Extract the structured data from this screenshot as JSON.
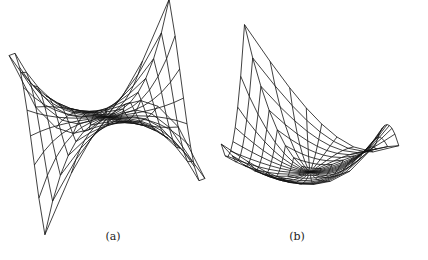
{
  "figure": {
    "panels": [
      {
        "id": "a",
        "label": "(a)"
      },
      {
        "id": "b",
        "label": "(b)"
      }
    ]
  },
  "chart_data": [
    {
      "type": "surface-wireframe",
      "title": "(a)",
      "mesh": {
        "rings": 8,
        "spokes": 32,
        "domain": "square [-1,1]x[-1,1], polar-style mesh"
      },
      "surface": "monkey-saddle-like, z = r^3 cos(3θ+φ)",
      "projection": {
        "cx": 107,
        "cy": 117,
        "A": 82,
        "B": 22,
        "H": 48,
        "psi": -0.22,
        "phi": 1.9
      },
      "stroke": "#111111",
      "grid": false,
      "axes": false
    },
    {
      "type": "surface-wireframe",
      "title": "(b)",
      "mesh": {
        "rings": 8,
        "spokes": 32,
        "domain": "square [-1,1]x[-1,1], polar-style mesh"
      },
      "surface": "asymmetric funnel, z = -0.5 + 0.55 r^2 + 0.35 r^2 sin(2θ+φ) + 0.25 r^3 cos(3θ)",
      "projection": {
        "cx": 310,
        "cy": 146,
        "A": 78,
        "B": 30,
        "H": 52,
        "psi": 0.15,
        "phi": 0.6
      },
      "stroke": "#111111",
      "grid": false,
      "axes": false
    }
  ]
}
